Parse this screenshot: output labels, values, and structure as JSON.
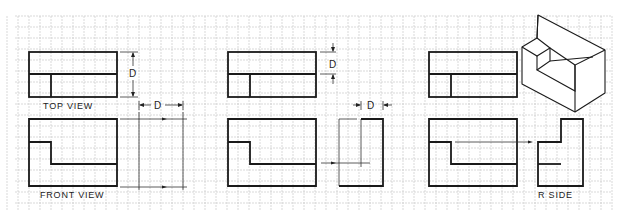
{
  "figure": {
    "panels": [
      {
        "id": "panel-1",
        "labels": {
          "top_view": "TOP VIEW",
          "front_view": "FRONT VIEW"
        },
        "dimensions": {
          "vertical": "D",
          "horizontal": "D"
        }
      },
      {
        "id": "panel-2",
        "dimensions": {
          "vertical": "D",
          "horizontal": "D"
        }
      },
      {
        "id": "panel-3",
        "labels": {
          "side_view": "R SIDE"
        }
      }
    ],
    "colors": {
      "line": "#1a1a1a",
      "grid": "#c9c9c9",
      "background": "#ffffff"
    }
  }
}
